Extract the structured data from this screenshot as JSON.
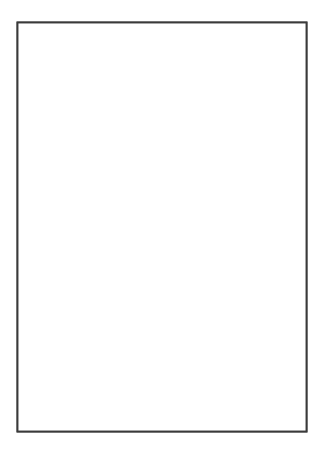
{
  "figure": {
    "title": "",
    "caption": "",
    "domain_type": "line-drawing-diagram",
    "background_color": "#ffffff",
    "frame": {
      "stroke_color": "#3a3a3a",
      "stroke_width": 1.9,
      "x": 17,
      "y": 22,
      "width": 290,
      "height": 410
    },
    "colors": {
      "ink": "#2b2b2b",
      "frame": "#3a3a3a",
      "separatrix": "#111111",
      "stipple_fill": "#1a1a1a",
      "paper": "#ffffff",
      "node_fill": "#ffffff"
    },
    "legend_entries": [],
    "axis_labels": [],
    "tick_labels": [],
    "annotations": []
  },
  "chart_data": {
    "type": "diagram",
    "title": "",
    "xlabel": "",
    "ylabel": "",
    "grid": false,
    "legend_position": "none",
    "xlim": [
      17,
      307
    ],
    "ylim": [
      22,
      432
    ],
    "nodes": [
      {
        "id": "n1",
        "label": "",
        "type": "o-point",
        "x": 53,
        "y": 104,
        "radius": 6.0,
        "spokes": 9
      },
      {
        "id": "n2",
        "label": "",
        "type": "o-point",
        "x": 155,
        "y": 128,
        "radius": 9.5,
        "spokes": 10
      },
      {
        "id": "n3",
        "label": "",
        "type": "o-point",
        "x": 108,
        "y": 206,
        "radius": 5.0,
        "spokes": 4
      },
      {
        "id": "n4",
        "label": "",
        "type": "o-point",
        "x": 175,
        "y": 265,
        "radius": 5.5,
        "spokes": 9
      },
      {
        "id": "n5",
        "label": "",
        "type": "o-point",
        "x": 157,
        "y": 337,
        "radius": 9.0,
        "spokes": 11
      },
      {
        "id": "x1",
        "label": "",
        "type": "x-point",
        "x": 249,
        "y": 272,
        "radius": 1.8,
        "spokes": 6
      }
    ],
    "regions": [
      {
        "id": "stippled-upper-right",
        "label": "",
        "fill_pattern": "checker-stipple",
        "fill_color": "#1a1a1a",
        "area_fraction": 0.27
      }
    ],
    "separatrix_segments": 7,
    "fieldline_count": 52
  }
}
